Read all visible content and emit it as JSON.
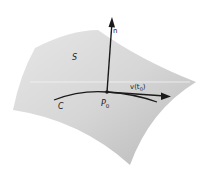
{
  "diagram": {
    "labels": {
      "surface": "S",
      "normal": "n",
      "curve": "C",
      "point": "P",
      "point_sub": "0",
      "velocity": "v(t",
      "velocity_sub": "0",
      "velocity_close": ")"
    },
    "colors": {
      "surface_light": "#e4e4e4",
      "surface_dark": "#bdbdbd",
      "ink": "#1a1a1a"
    }
  }
}
